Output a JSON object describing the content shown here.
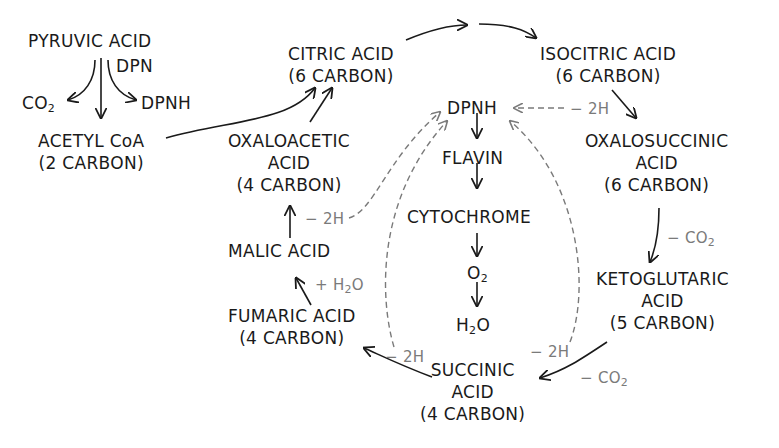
{
  "diagram": {
    "nodes": {
      "pyruvic": {
        "line1": "PYRUVIC ACID"
      },
      "dpn": {
        "label": "DPN"
      },
      "co2_left": {
        "label": "CO",
        "sub": "2"
      },
      "dpnh_left": {
        "label": "DPNH"
      },
      "acetyl": {
        "line1": "ACETYL CoA",
        "line2": "(2 CARBON)"
      },
      "citric": {
        "line1": "CITRIC ACID",
        "line2": "(6 CARBON)"
      },
      "isocitric": {
        "line1": "ISOCITRIC ACID",
        "line2": "(6 CARBON)"
      },
      "oxalosuccinic": {
        "line1": "OXALOSUCCINIC",
        "line2": "ACID",
        "line3": "(6 CARBON)"
      },
      "ketoglutaric": {
        "line1": "KETOGLUTARIC",
        "line2": "ACID",
        "line3": "(5 CARBON)"
      },
      "succinic": {
        "line1": "SUCCINIC",
        "line2": "ACID",
        "line3": "(4 CARBON)"
      },
      "fumaric": {
        "line1": "FUMARIC ACID",
        "line2": "(4 CARBON)"
      },
      "malic": {
        "line1": "MALIC ACID"
      },
      "oxaloacetic": {
        "line1": "OXALOACETIC",
        "line2": "ACID",
        "line3": "(4 CARBON)"
      },
      "dpnh_center": {
        "label": "DPNH"
      },
      "flavin": {
        "label": "FLAVIN"
      },
      "cytochrome": {
        "label": "CYTOCHROME"
      },
      "o2": {
        "label": "O",
        "sub": "2"
      },
      "h2o": {
        "pre": "H",
        "sub": "2",
        "post": "O"
      }
    },
    "annotations": {
      "minus_2h": "− 2H",
      "minus_co2": "− CO",
      "co2_sub": "2",
      "plus_h2o_pre": "+ H",
      "plus_h2o_sub": "2",
      "plus_h2o_post": "O"
    },
    "colors": {
      "main": "#1a1a1a",
      "secondary": "#7a7a7a",
      "background": "#ffffff"
    }
  }
}
